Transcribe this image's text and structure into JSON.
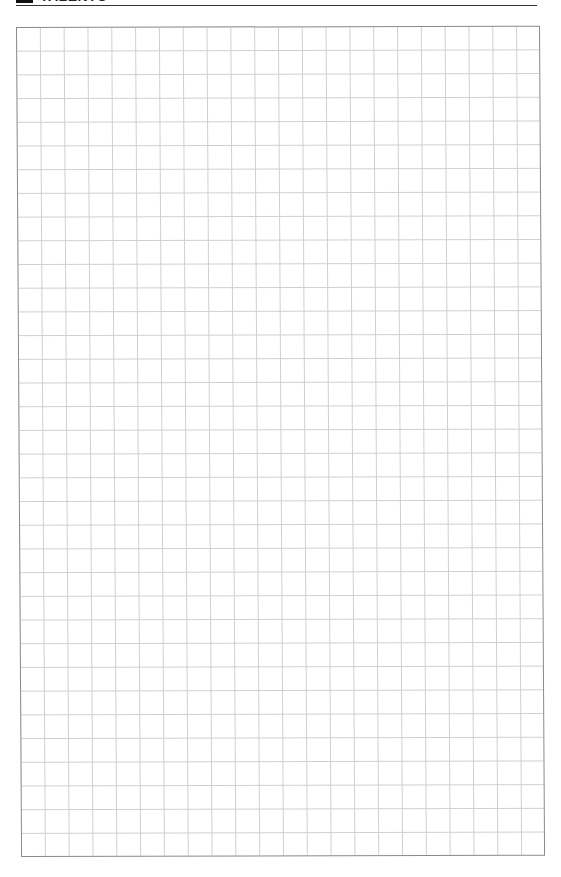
{
  "page": {
    "header": {
      "title": "TALENTS",
      "marker": "black-block"
    },
    "grid": {
      "columns": 22,
      "rows": 35,
      "cell_size_px": 24,
      "line_color": "#cfcfcf",
      "border_color": "#8a8a8a"
    }
  }
}
